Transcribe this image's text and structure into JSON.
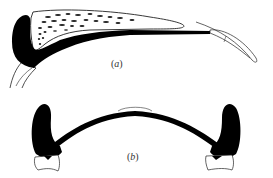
{
  "figure": {
    "panels": [
      {
        "id": "a",
        "label": "(a)",
        "paren_open": "(",
        "letter": "a",
        "paren_close": ")"
      },
      {
        "id": "b",
        "label": "(b)",
        "paren_open": "(",
        "letter": "b",
        "paren_close": ")"
      }
    ],
    "colors": {
      "ink": "#000000",
      "line": "#333333",
      "background": "#ffffff"
    }
  }
}
